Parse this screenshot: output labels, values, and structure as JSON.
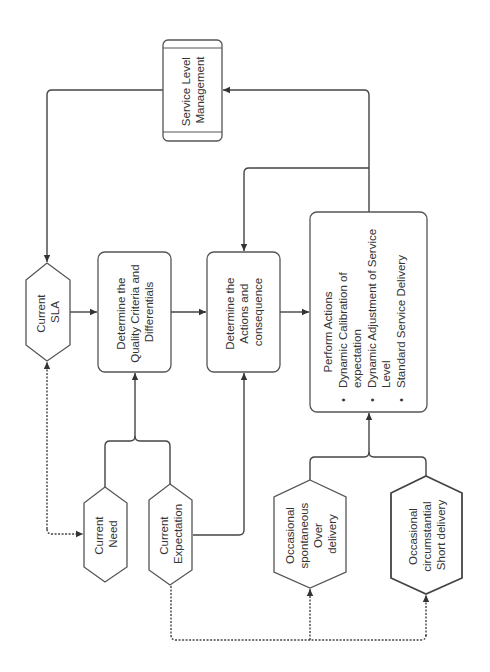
{
  "diagram": {
    "nodes": {
      "service_level_management": {
        "lines": [
          "Service Level",
          "Management"
        ]
      },
      "current_sla": {
        "lines": [
          "Current",
          "SLA"
        ]
      },
      "determine_quality": {
        "lines": [
          "Determine the",
          "Quality Criteria and",
          "Differentials"
        ]
      },
      "determine_actions": {
        "lines": [
          "Determine the",
          "Actions and",
          "consequence"
        ]
      },
      "perform_actions": {
        "title": "Perform Actions",
        "bullets": [
          [
            "Dynamic Calibration of",
            "expectation"
          ],
          [
            "Dynamic Adjustment of Service",
            "Level"
          ],
          [
            "Standard Service Delivery"
          ]
        ],
        "bullet_glyph": "•"
      },
      "current_need": {
        "lines": [
          "Current",
          "Need"
        ]
      },
      "current_expectation": {
        "lines": [
          "Current",
          "Expectation"
        ]
      },
      "occasional_over": {
        "lines": [
          "Occasional",
          "spontaneous",
          "Over",
          "delivery"
        ]
      },
      "occasional_short": {
        "lines": [
          "Occasional",
          "circumstantial",
          "Short delivery"
        ]
      }
    },
    "colors": {
      "stroke": "#444444",
      "text": "#333333",
      "background": "#ffffff"
    }
  }
}
